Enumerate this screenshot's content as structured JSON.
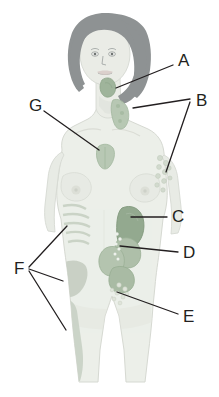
{
  "diagram": {
    "background_color": "#ffffff",
    "colors": {
      "body_fill": "#eceeea",
      "body_outline": "#d3d6cf",
      "hair": "#8f9394",
      "skin_shade": "#dfe2dc",
      "organ_green_dark": "#8fa68c",
      "organ_green_mid": "#a8bda4",
      "organ_green_light": "#c2d0bd",
      "node_cluster": "#cfd8ca",
      "leader_line": "#231f20",
      "label_text": "#231f20"
    },
    "labels": [
      {
        "id": "A",
        "text": "A",
        "x": 178,
        "y": 60,
        "organ": "tonsils"
      },
      {
        "id": "B",
        "text": "B",
        "x": 196,
        "y": 101,
        "organ": "axillary-and-cervical-lymph-nodes"
      },
      {
        "id": "C",
        "text": "C",
        "x": 172,
        "y": 216,
        "organ": "spleen"
      },
      {
        "id": "D",
        "text": "D",
        "x": 183,
        "y": 252,
        "organ": "peyers-patches-intestines"
      },
      {
        "id": "E",
        "text": "E",
        "x": 183,
        "y": 317,
        "organ": "inguinal-lymph-nodes"
      },
      {
        "id": "F",
        "text": "F",
        "x": 14,
        "y": 268,
        "organ": "bone-marrow"
      },
      {
        "id": "G",
        "text": "G",
        "x": 29,
        "y": 105,
        "organ": "thymus"
      }
    ],
    "leader_lines": [
      {
        "for": "A",
        "points": "173,66 116,88"
      },
      {
        "for": "B",
        "points": "191,104 139,112"
      },
      {
        "for": "B2",
        "points": "191,107 165,170"
      },
      {
        "for": "C",
        "points": "168,218 131,218"
      },
      {
        "for": "D",
        "points": "178,252 121,248"
      },
      {
        "for": "E",
        "points": "178,314 117,293"
      },
      {
        "for": "F1",
        "points": "28,268 66,226"
      },
      {
        "for": "F2",
        "points": "28,270 62,280"
      },
      {
        "for": "F3",
        "points": "28,272 64,330"
      },
      {
        "for": "G",
        "points": "44,112 98,148"
      }
    ],
    "organs": [
      {
        "name": "tonsils",
        "label": "A",
        "region": "throat"
      },
      {
        "name": "cervical lymph nodes",
        "label": "B",
        "region": "neck"
      },
      {
        "name": "axillary lymph nodes",
        "label": "B",
        "region": "armpit"
      },
      {
        "name": "spleen",
        "label": "C",
        "region": "upper left abdomen"
      },
      {
        "name": "intestinal lymphoid tissue",
        "label": "D",
        "region": "abdomen"
      },
      {
        "name": "inguinal lymph nodes",
        "label": "E",
        "region": "groin"
      },
      {
        "name": "bone marrow",
        "label": "F",
        "region": "ribs, pelvis, femur"
      },
      {
        "name": "thymus",
        "label": "G",
        "region": "upper chest"
      }
    ]
  }
}
